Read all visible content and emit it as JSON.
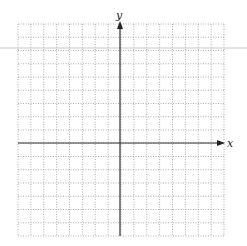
{
  "chart_data": {
    "type": "scatter",
    "title": "",
    "xlabel": "x",
    "ylabel": "y",
    "grid": true,
    "grid_style": "dotted",
    "xlim": [
      -8,
      8
    ],
    "ylim": [
      -7,
      9
    ],
    "grid_columns": 16,
    "grid_rows": 16,
    "series": [],
    "tick_labels": [],
    "legend": null
  },
  "colors": {
    "grid": "#9a9a9a",
    "axis": "#333333",
    "stray_line": "#c8c8c8"
  },
  "labels": {
    "x_axis": "x",
    "y_axis": "y"
  }
}
